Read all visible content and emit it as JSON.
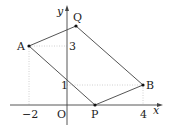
{
  "diagram": {
    "axes": {
      "x_label": "x",
      "y_label": "y",
      "origin_label": "O",
      "x_ticks": [
        {
          "value": -2,
          "label": "−2"
        },
        {
          "value": 4,
          "label": "4"
        }
      ],
      "y_ticks": [
        {
          "value": 1,
          "label": "1"
        },
        {
          "value": 3,
          "label": "3"
        }
      ]
    },
    "points": [
      {
        "name": "A",
        "coords": [
          -2,
          3
        ]
      },
      {
        "name": "B",
        "coords": [
          4,
          1
        ]
      },
      {
        "name": "P",
        "coords": [
          null,
          0
        ]
      },
      {
        "name": "Q",
        "coords": [
          0,
          null
        ]
      }
    ],
    "polygon": [
      "A",
      "P",
      "B",
      "Q"
    ],
    "labels": {
      "A": "A",
      "B": "B",
      "P": "P",
      "Q": "Q",
      "x": "x",
      "y": "y",
      "O": "O",
      "tick_neg2": "−2",
      "tick_4": "4",
      "tick_1": "1",
      "tick_3": "3"
    },
    "colors": {
      "line": "#555555",
      "guide": "#bbbbbb",
      "point": "#111111",
      "text": "#222222"
    }
  }
}
